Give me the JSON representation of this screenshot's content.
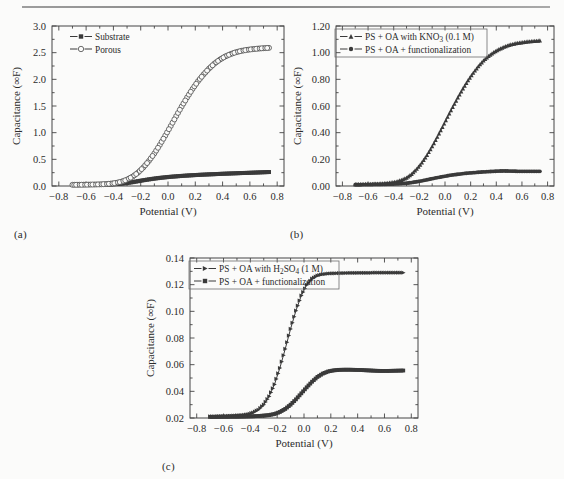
{
  "figure": {
    "background": "#fbfbfa",
    "axis_color": "#444444",
    "text_color": "#2b2b2b"
  },
  "panels": [
    {
      "id": "a",
      "label": "(a)"
    },
    {
      "id": "b",
      "label": "(b)"
    },
    {
      "id": "c",
      "label": "(c)"
    }
  ],
  "chart_data": [
    {
      "type": "line",
      "panel": "a",
      "title": "",
      "xlabel": "Potential (V)",
      "ylabel": "Capacitance (∞F)",
      "xlim": [
        -0.85,
        0.85
      ],
      "ylim": [
        0.0,
        3.0
      ],
      "xticks": [
        "-0.8",
        "-0.6",
        "-0.4",
        "-0.2",
        "0.0",
        "0.2",
        "0.4",
        "0.6",
        "0.8"
      ],
      "xtick_values": [
        -0.8,
        -0.6,
        -0.4,
        -0.2,
        0.0,
        0.2,
        0.4,
        0.6,
        0.8
      ],
      "yticks": [
        "0.0",
        "0.5",
        "1.0",
        "1.5",
        "2.0",
        "2.5",
        "3.0"
      ],
      "ytick_values": [
        0.0,
        0.5,
        1.0,
        1.5,
        2.0,
        2.5,
        3.0
      ],
      "grid": false,
      "legend_position": "top-left",
      "x": [
        -0.7,
        -0.66,
        -0.62,
        -0.58,
        -0.54,
        -0.5,
        -0.46,
        -0.42,
        -0.38,
        -0.34,
        -0.3,
        -0.26,
        -0.22,
        -0.18,
        -0.14,
        -0.1,
        -0.06,
        -0.02,
        0.02,
        0.06,
        0.1,
        0.14,
        0.18,
        0.22,
        0.26,
        0.3,
        0.34,
        0.38,
        0.42,
        0.46,
        0.5,
        0.54,
        0.58,
        0.62,
        0.66,
        0.7,
        0.74
      ],
      "series": [
        {
          "name": "Substrate",
          "marker": "filled-square",
          "color": "#3a3a3a",
          "values": [
            0.02,
            0.021,
            0.022,
            0.023,
            0.024,
            0.026,
            0.028,
            0.031,
            0.036,
            0.044,
            0.056,
            0.072,
            0.09,
            0.108,
            0.124,
            0.139,
            0.152,
            0.163,
            0.173,
            0.181,
            0.189,
            0.196,
            0.202,
            0.208,
            0.213,
            0.218,
            0.222,
            0.227,
            0.231,
            0.235,
            0.239,
            0.243,
            0.246,
            0.25,
            0.254,
            0.258,
            0.262
          ]
        },
        {
          "name": "Porous",
          "marker": "open-circle",
          "color": "#4a4a4a",
          "values": [
            0.022,
            0.023,
            0.024,
            0.026,
            0.028,
            0.031,
            0.036,
            0.044,
            0.058,
            0.082,
            0.12,
            0.175,
            0.25,
            0.35,
            0.47,
            0.61,
            0.77,
            0.945,
            1.125,
            1.31,
            1.49,
            1.66,
            1.82,
            1.965,
            2.09,
            2.2,
            2.295,
            2.37,
            2.43,
            2.475,
            2.51,
            2.535,
            2.553,
            2.566,
            2.576,
            2.584,
            2.59
          ]
        }
      ]
    },
    {
      "type": "line",
      "panel": "b",
      "title": "",
      "xlabel": "Potential (V)",
      "ylabel": "Capacitance (∞F)",
      "xlim": [
        -0.85,
        0.85
      ],
      "ylim": [
        0.0,
        1.2
      ],
      "xticks": [
        "-0.8",
        "-0.6",
        "-0.4",
        "-0.2",
        "0.0",
        "0.2",
        "0.4",
        "0.6",
        "0.8"
      ],
      "xtick_values": [
        -0.8,
        -0.6,
        -0.4,
        -0.2,
        0.0,
        0.2,
        0.4,
        0.6,
        0.8
      ],
      "yticks": [
        "0.00",
        "0.20",
        "0.40",
        "0.60",
        "0.80",
        "1.00",
        "1.20"
      ],
      "ytick_values": [
        0.0,
        0.2,
        0.4,
        0.6,
        0.8,
        1.0,
        1.2
      ],
      "grid": false,
      "legend_position": "top-left",
      "x": [
        -0.7,
        -0.66,
        -0.62,
        -0.58,
        -0.54,
        -0.5,
        -0.46,
        -0.42,
        -0.38,
        -0.34,
        -0.3,
        -0.26,
        -0.22,
        -0.18,
        -0.14,
        -0.1,
        -0.06,
        -0.02,
        0.02,
        0.06,
        0.1,
        0.14,
        0.18,
        0.22,
        0.26,
        0.3,
        0.34,
        0.38,
        0.42,
        0.46,
        0.5,
        0.54,
        0.58,
        0.62,
        0.66,
        0.7,
        0.74
      ],
      "series": [
        {
          "name": "PS + OA with KNO3 (0.1 M)",
          "name_parts": {
            "pre": "PS + OA with KNO",
            "sub": "3",
            "post": " (0.1 M)"
          },
          "marker": "filled-triangle",
          "color": "#3a3a3a",
          "values": [
            0.012,
            0.013,
            0.014,
            0.015,
            0.016,
            0.018,
            0.021,
            0.025,
            0.032,
            0.044,
            0.062,
            0.09,
            0.128,
            0.175,
            0.232,
            0.297,
            0.368,
            0.442,
            0.518,
            0.592,
            0.663,
            0.73,
            0.792,
            0.848,
            0.898,
            0.94,
            0.975,
            1.003,
            1.025,
            1.043,
            1.057,
            1.067,
            1.074,
            1.08,
            1.084,
            1.087,
            1.09
          ]
        },
        {
          "name": "PS + OA + functionalization",
          "marker": "filled-circle",
          "color": "#3a3a3a",
          "values": [
            0.01,
            0.01,
            0.011,
            0.011,
            0.012,
            0.012,
            0.013,
            0.014,
            0.016,
            0.018,
            0.021,
            0.026,
            0.032,
            0.039,
            0.047,
            0.055,
            0.063,
            0.07,
            0.077,
            0.083,
            0.088,
            0.093,
            0.097,
            0.1,
            0.103,
            0.106,
            0.108,
            0.11,
            0.112,
            0.113,
            0.112,
            0.111,
            0.11,
            0.11,
            0.11,
            0.11,
            0.11
          ]
        }
      ]
    },
    {
      "type": "line",
      "panel": "c",
      "title": "",
      "xlabel": "Potential (V)",
      "ylabel": "Capacitance (∞F)",
      "xlim": [
        -0.85,
        0.85
      ],
      "ylim": [
        0.02,
        0.14
      ],
      "xticks": [
        "-0.8",
        "-0.6",
        "-0.4",
        "-0.2",
        "0.0",
        "0.2",
        "0.4",
        "0.6",
        "0.8"
      ],
      "xtick_values": [
        -0.8,
        -0.6,
        -0.4,
        -0.2,
        0.0,
        0.2,
        0.4,
        0.6,
        0.8
      ],
      "yticks": [
        "0.02",
        "0.04",
        "0.06",
        "0.08",
        "0.10",
        "0.12",
        "0.14"
      ],
      "ytick_values": [
        0.02,
        0.04,
        0.06,
        0.08,
        0.1,
        0.12,
        0.14
      ],
      "grid": false,
      "legend_position": "top-left",
      "x": [
        -0.7,
        -0.66,
        -0.62,
        -0.58,
        -0.54,
        -0.5,
        -0.46,
        -0.42,
        -0.38,
        -0.34,
        -0.3,
        -0.26,
        -0.22,
        -0.18,
        -0.14,
        -0.1,
        -0.06,
        -0.02,
        0.02,
        0.06,
        0.1,
        0.14,
        0.18,
        0.22,
        0.26,
        0.3,
        0.34,
        0.38,
        0.42,
        0.46,
        0.5,
        0.54,
        0.58,
        0.62,
        0.66,
        0.7,
        0.74
      ],
      "series": [
        {
          "name": "PS + OA with H2SO4 (1 M)",
          "name_parts": {
            "pre": "PS + OA with H",
            "sub": "2",
            "mid": "SO",
            "sub2": "4",
            "post": " (1 M)"
          },
          "marker": "right-triangle",
          "color": "#3a3a3a",
          "values": [
            0.0212,
            0.0213,
            0.0214,
            0.0215,
            0.0217,
            0.0219,
            0.0222,
            0.0228,
            0.024,
            0.0262,
            0.03,
            0.0362,
            0.0452,
            0.0575,
            0.0718,
            0.0868,
            0.1005,
            0.1118,
            0.1198,
            0.1245,
            0.1268,
            0.1278,
            0.1283,
            0.1285,
            0.1286,
            0.1287,
            0.1288,
            0.1288,
            0.1289,
            0.1289,
            0.1289,
            0.129,
            0.129,
            0.129,
            0.129,
            0.129,
            0.129
          ]
        },
        {
          "name": "PS + OA + functionalization",
          "marker": "filled-square",
          "color": "#3a3a3a",
          "values": [
            0.0208,
            0.0208,
            0.0209,
            0.0209,
            0.021,
            0.021,
            0.0211,
            0.0212,
            0.0213,
            0.0215,
            0.0218,
            0.0222,
            0.023,
            0.0245,
            0.0268,
            0.03,
            0.034,
            0.0385,
            0.043,
            0.0472,
            0.0508,
            0.0533,
            0.0549,
            0.0557,
            0.0561,
            0.0562,
            0.0562,
            0.0561,
            0.056,
            0.0558,
            0.0556,
            0.0554,
            0.0553,
            0.0553,
            0.0554,
            0.0555,
            0.0556
          ]
        }
      ]
    }
  ]
}
